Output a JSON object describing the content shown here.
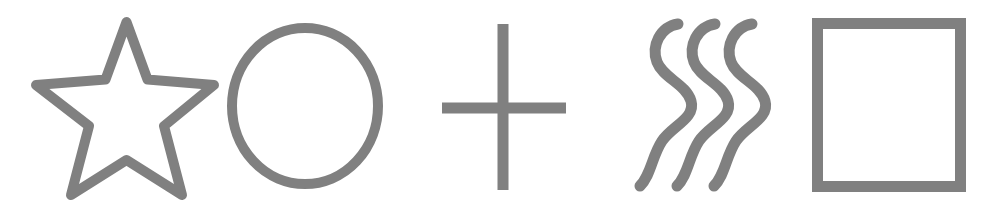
{
  "canvas": {
    "width": 996,
    "height": 214,
    "background_color": "#ffffff",
    "description": "Row of five gray outline shapes on a white background"
  },
  "style": {
    "stroke_color": "#808080",
    "stroke_width": 10,
    "fill": "none"
  },
  "shapes": [
    {
      "id": "star",
      "name": "five-pointed-star",
      "label": "Star",
      "stroke_color": "#808080",
      "stroke_width": 10,
      "bounds": {
        "x": 33,
        "y": 22,
        "width": 185,
        "height": 177
      },
      "center": {
        "x": 126,
        "y": 112
      },
      "points": 5,
      "outer_radius": 92,
      "inner_radius": 38,
      "path": "M 126.5 22 L 147.5 79.5 L 214 85 L 164 126 L 182 195 L 126.5 160 L 71 195 L 89 126 L 36 85 L 105.5 79.5 Z",
      "join": "round"
    },
    {
      "id": "circle",
      "name": "circle-outline",
      "label": "Circle",
      "stroke_color": "#808080",
      "stroke_width": 10,
      "bounds": {
        "x": 227,
        "y": 23,
        "width": 156,
        "height": 166
      },
      "center": {
        "x": 305,
        "y": 106
      },
      "radius_x": 73,
      "radius_y": 78
    },
    {
      "id": "plus",
      "name": "plus-cross",
      "label": "Plus",
      "stroke_color": "#808080",
      "stroke_width": 11,
      "bounds": {
        "x": 442,
        "y": 24,
        "width": 124,
        "height": 166
      },
      "center": {
        "x": 503,
        "y": 108
      },
      "vertical_line": {
        "x": 503,
        "y1": 24,
        "y2": 190
      },
      "horizontal_line": {
        "y": 108,
        "x1": 442,
        "x2": 566
      }
    },
    {
      "id": "squiggles",
      "name": "wavy-lines",
      "label": "Squiggles",
      "stroke_color": "#808080",
      "stroke_width": 11,
      "bounds": {
        "x": 633,
        "y": 18,
        "width": 142,
        "height": 174
      },
      "line_count": 3,
      "wave_cycles": 2.5,
      "x_offsets": [
        0,
        37,
        74
      ],
      "base_path": "M 678 24 C 660 27 651 46 657 62 C 663 78 686 84 691 101 C 696 118 672 126 662 141 C 652 156 651 175 640 186"
    },
    {
      "id": "rectangle",
      "name": "rectangle-outline",
      "label": "Rectangle",
      "stroke_color": "#808080",
      "stroke_width": 11,
      "bounds": {
        "x": 812,
        "y": 18,
        "width": 154,
        "height": 174
      },
      "corner_radius": 0,
      "join": "miter"
    }
  ]
}
